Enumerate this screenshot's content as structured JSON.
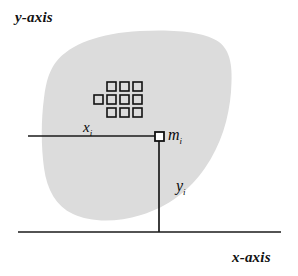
{
  "figure": {
    "background_color": "#ffffff",
    "line_color": "#1a1a1a",
    "area_fill_color": "#dcdcdc",
    "axes": {
      "y_axis_label": "y-axis",
      "x_axis_label": "x-axis"
    },
    "labels": {
      "x_distance": "x",
      "x_distance_sub": "i",
      "y_distance": "y",
      "y_distance_sub": "i",
      "mass_element": "m",
      "mass_element_sub": "i"
    },
    "marker": {
      "name": "mass-element-marker",
      "shape": "square-outline",
      "x": 159,
      "y": 136
    },
    "mass_grid": {
      "description": "array of small hollow squares representing discrete mass elements",
      "rows": 3,
      "columns": 3,
      "extra_left_square_on_middle_row": true,
      "square_size": 9,
      "spacing": 13
    },
    "geometry": {
      "x_axis_line": {
        "x1": 18,
        "y1": 232,
        "x2": 281,
        "y2": 232
      },
      "xi_line": {
        "x1": 28,
        "y1": 136,
        "x2": 159,
        "y2": 136
      },
      "yi_line": {
        "x1": 159,
        "y1": 136,
        "x2": 159,
        "y2": 232
      }
    }
  }
}
